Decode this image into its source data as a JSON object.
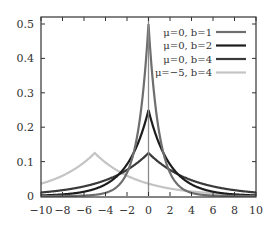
{
  "chart_data": {
    "type": "line",
    "title": "",
    "xlabel": "",
    "ylabel": "",
    "xlim": [
      -10,
      10
    ],
    "ylim": [
      0,
      0.52
    ],
    "grid": false,
    "legend_position": "upper right",
    "x_ticks": [
      -10,
      -8,
      -6,
      -4,
      -2,
      0,
      2,
      4,
      6,
      8,
      10
    ],
    "x_tick_labels": [
      "−10",
      "−8",
      "−6",
      "−4",
      "−2",
      "0",
      "2",
      "4",
      "6",
      "8",
      "10"
    ],
    "y_ticks": [
      0,
      0.1,
      0.2,
      0.3,
      0.4,
      0.5
    ],
    "y_tick_labels": [
      "0",
      "0.1",
      "0.2",
      "0.3",
      "0.4",
      "0.5"
    ],
    "function": "Laplace PDF f(x) = exp(-|x-μ|/b) / (2b)",
    "series": [
      {
        "name": "μ=0, b=1",
        "mu": 0,
        "b": 1,
        "color": "#6e6e6e",
        "peak": 0.5,
        "peak_x": 0
      },
      {
        "name": "μ=0, b=2",
        "mu": 0,
        "b": 2,
        "color": "#1c1c1c",
        "peak": 0.25,
        "peak_x": 0
      },
      {
        "name": "μ=0, b=4",
        "mu": 0,
        "b": 4,
        "color": "#3a3a3a",
        "peak": 0.125,
        "peak_x": 0
      },
      {
        "name": "μ=−5, b=4",
        "mu": -5,
        "b": 4,
        "color": "#c4c4c4",
        "peak": 0.125,
        "peak_x": -5
      }
    ],
    "annotations": [
      {
        "type": "vertical_line",
        "x": 0,
        "color": "#8a8a8a"
      }
    ]
  }
}
